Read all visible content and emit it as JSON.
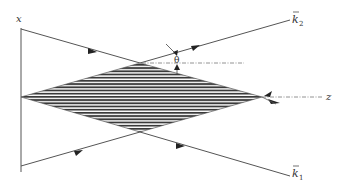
{
  "diagram": {
    "type": "wave-interference-geometry",
    "labels": {
      "x_axis": "x",
      "z_axis": "z",
      "theta": "θ",
      "k2": "k",
      "k2_sub": "2",
      "k1": "k",
      "k1_sub": "1"
    },
    "colors": {
      "line": "#555555",
      "hatch": "#3a3a3a",
      "dash": "#777777"
    },
    "elements": [
      "vertical x-axis",
      "hatched diamond interference region",
      "incident ray k1 (from lower-left, exits lower-right)",
      "incident ray k2 (from upper-left, exits upper-right)",
      "dash-dot horizontal reference lines",
      "angle theta marker"
    ]
  }
}
